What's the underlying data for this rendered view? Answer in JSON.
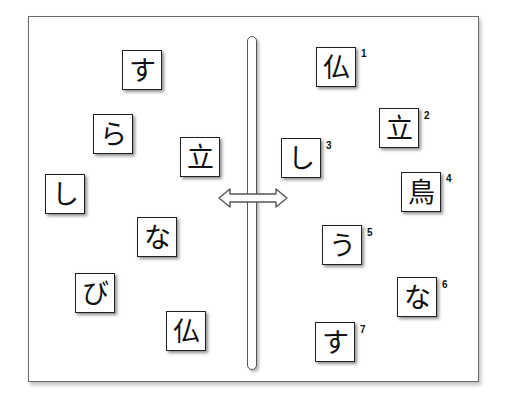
{
  "diagram": {
    "left_cards": [
      {
        "char": "す",
        "x": 122,
        "y": 50
      },
      {
        "char": "ら",
        "x": 93,
        "y": 114
      },
      {
        "char": "立",
        "x": 180,
        "y": 137
      },
      {
        "char": "し",
        "x": 45,
        "y": 174
      },
      {
        "char": "な",
        "x": 137,
        "y": 217
      },
      {
        "char": "び",
        "x": 75,
        "y": 273
      },
      {
        "char": "仏",
        "x": 166,
        "y": 311
      }
    ],
    "right_cards": [
      {
        "char": "仏",
        "number": "1",
        "x": 316,
        "y": 47
      },
      {
        "char": "立",
        "number": "2",
        "x": 379,
        "y": 108
      },
      {
        "char": "し",
        "number": "3",
        "x": 281,
        "y": 138
      },
      {
        "char": "鳥",
        "number": "4",
        "x": 401,
        "y": 172
      },
      {
        "char": "う",
        "number": "5",
        "x": 322,
        "y": 225
      },
      {
        "char": "な",
        "number": "6",
        "x": 397,
        "y": 277
      },
      {
        "char": "す",
        "number": "7",
        "x": 315,
        "y": 322
      }
    ],
    "divider_icon": "vertical-bar-with-horizontal-double-arrow"
  }
}
